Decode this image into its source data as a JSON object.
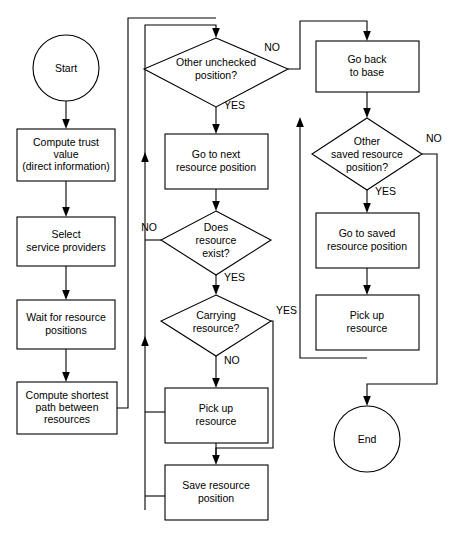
{
  "diagram": {
    "type": "flowchart",
    "canvas": {
      "width": 455,
      "height": 540
    },
    "colors": {
      "stroke": "#000000",
      "fill": "#ffffff",
      "text": "#000000"
    }
  },
  "nodes": [
    {
      "id": "start",
      "shape": "terminator",
      "label": "Start",
      "lines": [
        "Start"
      ]
    },
    {
      "id": "compute-trust",
      "shape": "process",
      "label": "Compute trust value (direct information)",
      "lines": [
        "Compute trust",
        "value",
        "(direct information)"
      ]
    },
    {
      "id": "select-providers",
      "shape": "process",
      "label": "Select service providers",
      "lines": [
        "Select",
        "service providers"
      ]
    },
    {
      "id": "wait-positions",
      "shape": "process",
      "label": "Wait for resource positions",
      "lines": [
        "Wait for resource",
        "positions"
      ]
    },
    {
      "id": "compute-path",
      "shape": "process",
      "label": "Compute shortest path between resources",
      "lines": [
        "Compute shortest",
        "path between",
        "resources"
      ]
    },
    {
      "id": "other-unchecked",
      "shape": "decision",
      "label": "Other unchecked position?",
      "lines": [
        "Other unchecked",
        "position?"
      ]
    },
    {
      "id": "go-next",
      "shape": "process",
      "label": "Go to next resource position",
      "lines": [
        "Go to next",
        "resource position"
      ]
    },
    {
      "id": "resource-exist",
      "shape": "decision",
      "label": "Does resource exist?",
      "lines": [
        "Does",
        "resource",
        "exist?"
      ]
    },
    {
      "id": "carrying",
      "shape": "decision",
      "label": "Carrying resource?",
      "lines": [
        "Carrying",
        "resource?"
      ]
    },
    {
      "id": "pickup-mid",
      "shape": "process",
      "label": "Pick up resource",
      "lines": [
        "Pick up",
        "resource"
      ]
    },
    {
      "id": "save-position",
      "shape": "process",
      "label": "Save resource position",
      "lines": [
        "Save resource",
        "position"
      ]
    },
    {
      "id": "go-base",
      "shape": "process",
      "label": "Go back to base",
      "lines": [
        "Go back",
        "to base"
      ]
    },
    {
      "id": "other-saved",
      "shape": "decision",
      "label": "Other saved resource position?",
      "lines": [
        "Other",
        "saved resource",
        "position?"
      ]
    },
    {
      "id": "go-saved",
      "shape": "process",
      "label": "Go to saved resource position",
      "lines": [
        "Go to saved",
        "resource position"
      ]
    },
    {
      "id": "pickup-right",
      "shape": "process",
      "label": "Pick up resource",
      "lines": [
        "Pick up",
        "resource"
      ]
    },
    {
      "id": "end",
      "shape": "terminator",
      "label": "End",
      "lines": [
        "End"
      ]
    }
  ],
  "edge_labels": [
    {
      "id": "unchecked-no",
      "text": "NO",
      "from": "other-unchecked",
      "to": "go-base"
    },
    {
      "id": "unchecked-yes",
      "text": "YES",
      "from": "other-unchecked",
      "to": "go-next"
    },
    {
      "id": "exist-no",
      "text": "NO",
      "from": "resource-exist",
      "to": "other-unchecked"
    },
    {
      "id": "exist-yes",
      "text": "YES",
      "from": "resource-exist",
      "to": "carrying"
    },
    {
      "id": "carrying-yes",
      "text": "YES",
      "from": "carrying",
      "to": "save-position"
    },
    {
      "id": "carrying-no",
      "text": "NO",
      "from": "carrying",
      "to": "pickup-mid"
    },
    {
      "id": "saved-no",
      "text": "NO",
      "from": "other-saved",
      "to": "end"
    },
    {
      "id": "saved-yes",
      "text": "YES",
      "from": "other-saved",
      "to": "go-saved"
    }
  ]
}
